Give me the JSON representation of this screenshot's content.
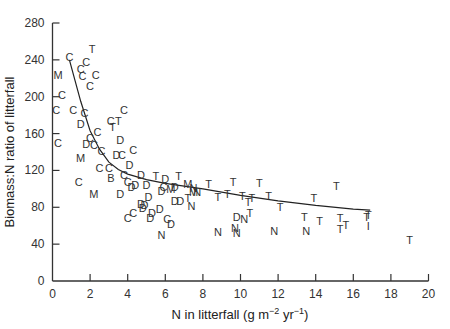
{
  "chart_data": {
    "type": "scatter",
    "title": "",
    "xlabel": "N in litterfall (g m⁻² yr⁻¹)",
    "xlabel_parts": {
      "main": "N in litterfall (g m",
      "exp1": "−2",
      "mid": " yr",
      "exp2": "−1",
      "end": ")"
    },
    "ylabel": "Biomass:N ratio of litterfall",
    "xlim": [
      0,
      20
    ],
    "ylim": [
      0,
      280
    ],
    "xticks": [
      0,
      2,
      4,
      6,
      8,
      10,
      12,
      14,
      16,
      18,
      20
    ],
    "yticks": [
      0,
      40,
      80,
      120,
      160,
      200,
      240,
      280
    ],
    "grid": false,
    "legend": "none (points plotted as letter markers C, D, M, N, T, B, I)",
    "marker_codes": [
      "C",
      "D",
      "M",
      "N",
      "T",
      "B",
      "I"
    ],
    "points": [
      {
        "x": 0.9,
        "y": 243,
        "label": "C"
      },
      {
        "x": 2.1,
        "y": 252,
        "label": "T"
      },
      {
        "x": 1.8,
        "y": 238,
        "label": "C"
      },
      {
        "x": 1.5,
        "y": 230,
        "label": "C"
      },
      {
        "x": 0.3,
        "y": 224,
        "label": "M"
      },
      {
        "x": 1.6,
        "y": 222,
        "label": "C"
      },
      {
        "x": 2.3,
        "y": 224,
        "label": "C"
      },
      {
        "x": 2.0,
        "y": 212,
        "label": "C"
      },
      {
        "x": 0.5,
        "y": 202,
        "label": "C"
      },
      {
        "x": 0.2,
        "y": 186,
        "label": "C"
      },
      {
        "x": 1.1,
        "y": 186,
        "label": "C"
      },
      {
        "x": 1.7,
        "y": 182,
        "label": "C"
      },
      {
        "x": 1.5,
        "y": 170,
        "label": "D"
      },
      {
        "x": 3.8,
        "y": 186,
        "label": "C"
      },
      {
        "x": 3.1,
        "y": 174,
        "label": "C"
      },
      {
        "x": 3.5,
        "y": 174,
        "label": "T"
      },
      {
        "x": 3.2,
        "y": 167,
        "label": "T"
      },
      {
        "x": 0.3,
        "y": 150,
        "label": "C"
      },
      {
        "x": 2.4,
        "y": 162,
        "label": "C"
      },
      {
        "x": 1.8,
        "y": 149,
        "label": "D"
      },
      {
        "x": 2.0,
        "y": 155,
        "label": "C"
      },
      {
        "x": 2.2,
        "y": 148,
        "label": "C"
      },
      {
        "x": 3.6,
        "y": 153,
        "label": "D"
      },
      {
        "x": 1.5,
        "y": 134,
        "label": "M"
      },
      {
        "x": 2.6,
        "y": 141,
        "label": "C"
      },
      {
        "x": 1.4,
        "y": 107,
        "label": "C"
      },
      {
        "x": 2.2,
        "y": 94,
        "label": "M"
      },
      {
        "x": 3.6,
        "y": 95,
        "label": "D"
      },
      {
        "x": 2.5,
        "y": 123,
        "label": "C"
      },
      {
        "x": 3.0,
        "y": 123,
        "label": "C"
      },
      {
        "x": 3.1,
        "y": 112,
        "label": "B"
      },
      {
        "x": 4.0,
        "y": 107,
        "label": "C"
      },
      {
        "x": 4.2,
        "y": 102,
        "label": "D"
      },
      {
        "x": 3.8,
        "y": 115,
        "label": "C"
      },
      {
        "x": 4.1,
        "y": 126,
        "label": "D"
      },
      {
        "x": 4.3,
        "y": 142,
        "label": "C"
      },
      {
        "x": 3.4,
        "y": 137,
        "label": "D"
      },
      {
        "x": 3.7,
        "y": 137,
        "label": "C"
      },
      {
        "x": 4.0,
        "y": 68,
        "label": "C"
      },
      {
        "x": 4.3,
        "y": 74,
        "label": "C"
      },
      {
        "x": 4.8,
        "y": 79,
        "label": "D"
      },
      {
        "x": 4.9,
        "y": 83,
        "label": "D"
      },
      {
        "x": 4.7,
        "y": 115,
        "label": "D"
      },
      {
        "x": 5.5,
        "y": 114,
        "label": "T"
      },
      {
        "x": 6.7,
        "y": 114,
        "label": "T"
      },
      {
        "x": 6.0,
        "y": 111,
        "label": "D"
      },
      {
        "x": 5.9,
        "y": 102,
        "label": "C"
      },
      {
        "x": 6.3,
        "y": 100,
        "label": "M"
      },
      {
        "x": 5.8,
        "y": 98,
        "label": "D"
      },
      {
        "x": 6.5,
        "y": 102,
        "label": "D"
      },
      {
        "x": 5.0,
        "y": 104,
        "label": "D"
      },
      {
        "x": 4.4,
        "y": 104,
        "label": "D"
      },
      {
        "x": 7.2,
        "y": 105,
        "label": "M"
      },
      {
        "x": 7.5,
        "y": 97,
        "label": "M"
      },
      {
        "x": 7.7,
        "y": 97,
        "label": "N"
      },
      {
        "x": 6.5,
        "y": 87,
        "label": "D"
      },
      {
        "x": 6.8,
        "y": 87,
        "label": "D"
      },
      {
        "x": 7.2,
        "y": 90,
        "label": "T"
      },
      {
        "x": 7.4,
        "y": 81,
        "label": "N"
      },
      {
        "x": 5.3,
        "y": 74,
        "label": "D"
      },
      {
        "x": 5.7,
        "y": 78,
        "label": "D"
      },
      {
        "x": 6.1,
        "y": 67,
        "label": "C"
      },
      {
        "x": 6.3,
        "y": 62,
        "label": "D"
      },
      {
        "x": 5.2,
        "y": 68,
        "label": "D"
      },
      {
        "x": 5.1,
        "y": 91,
        "label": "D"
      },
      {
        "x": 4.7,
        "y": 84,
        "label": "D"
      },
      {
        "x": 5.8,
        "y": 50,
        "label": "N"
      },
      {
        "x": 8.3,
        "y": 105,
        "label": "T"
      },
      {
        "x": 9.6,
        "y": 108,
        "label": "T"
      },
      {
        "x": 11.0,
        "y": 106,
        "label": "T"
      },
      {
        "x": 8.8,
        "y": 91,
        "label": "T"
      },
      {
        "x": 9.3,
        "y": 95,
        "label": "T"
      },
      {
        "x": 10.1,
        "y": 92,
        "label": "T"
      },
      {
        "x": 10.4,
        "y": 86,
        "label": "T"
      },
      {
        "x": 10.6,
        "y": 90,
        "label": "T"
      },
      {
        "x": 11.5,
        "y": 92,
        "label": "T"
      },
      {
        "x": 12.1,
        "y": 80,
        "label": "T"
      },
      {
        "x": 13.9,
        "y": 90,
        "label": "T"
      },
      {
        "x": 13.4,
        "y": 70,
        "label": "T"
      },
      {
        "x": 8.8,
        "y": 53,
        "label": "N"
      },
      {
        "x": 9.7,
        "y": 58,
        "label": "N"
      },
      {
        "x": 9.8,
        "y": 52,
        "label": "N"
      },
      {
        "x": 9.8,
        "y": 69,
        "label": "D"
      },
      {
        "x": 10.2,
        "y": 67,
        "label": "N"
      },
      {
        "x": 10.5,
        "y": 74,
        "label": "T"
      },
      {
        "x": 11.8,
        "y": 54,
        "label": "N"
      },
      {
        "x": 13.5,
        "y": 54,
        "label": "N"
      },
      {
        "x": 7.5,
        "y": 101,
        "label": "N"
      },
      {
        "x": 15.1,
        "y": 103,
        "label": "T"
      },
      {
        "x": 14.2,
        "y": 65,
        "label": "T"
      },
      {
        "x": 15.3,
        "y": 68,
        "label": "T"
      },
      {
        "x": 15.6,
        "y": 61,
        "label": "T"
      },
      {
        "x": 15.3,
        "y": 56,
        "label": "T"
      },
      {
        "x": 16.7,
        "y": 70,
        "label": "T"
      },
      {
        "x": 16.8,
        "y": 72,
        "label": "T"
      },
      {
        "x": 16.8,
        "y": 60,
        "label": "I"
      },
      {
        "x": 19.0,
        "y": 45,
        "label": "T"
      }
    ],
    "fit_curve": {
      "x": [
        0.9,
        1.5,
        2.0,
        2.5,
        3.0,
        3.5,
        4.0,
        5.0,
        6.0,
        8.0,
        10.0,
        12.0,
        14.0,
        16.0,
        16.9
      ],
      "y": [
        240,
        195,
        163,
        143,
        129,
        121,
        116,
        110,
        106,
        100,
        93,
        87,
        82,
        78,
        77
      ]
    }
  }
}
